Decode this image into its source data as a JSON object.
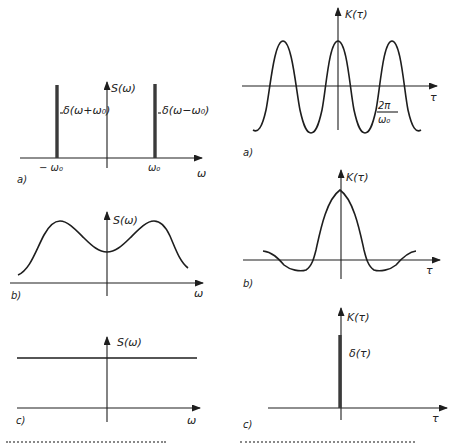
{
  "figure_left": {
    "panel_a": {
      "label": "a)",
      "y_axis": "S(ω)",
      "x_axis": "ω",
      "delta_left": "δ(ω+ω₀)",
      "delta_right": "δ(ω−ω₀)",
      "tick_left": "− ω₀",
      "tick_right": "ω₀"
    },
    "panel_b": {
      "label": "b)",
      "y_axis": "S(ω)",
      "x_axis": "ω"
    },
    "panel_c": {
      "label": "c)",
      "y_axis": "S(ω)",
      "x_axis": "ω"
    }
  },
  "figure_right": {
    "panel_a": {
      "label": "a)",
      "y_axis": "K(τ)",
      "x_axis": "τ",
      "period_num": "2π",
      "period_den": "ω₀"
    },
    "panel_b": {
      "label": "b)",
      "y_axis": "K(τ)",
      "x_axis": "τ"
    },
    "panel_c": {
      "label": "c)",
      "y_axis": "K(τ)",
      "x_axis": "τ",
      "delta": "δ(τ)"
    }
  }
}
